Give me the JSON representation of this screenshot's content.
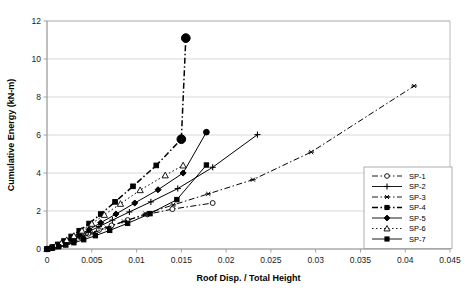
{
  "chart_data": {
    "type": "line",
    "title": "",
    "xlabel": "Roof Disp. / Total Height",
    "ylabel": "Cumulative Energy (kN-m)",
    "xlim": [
      0,
      0.045
    ],
    "ylim": [
      0,
      12
    ],
    "xticks": [
      "0",
      "0.005",
      "0.01",
      "0.015",
      "0.02",
      "0.025",
      "0.03",
      "0.035",
      "0.04",
      "0.045"
    ],
    "xtick_values": [
      0,
      0.005,
      0.01,
      0.015,
      0.02,
      0.025,
      0.03,
      0.035,
      0.04,
      0.045
    ],
    "yticks": [
      "0",
      "2",
      "4",
      "6",
      "8",
      "10",
      "12"
    ],
    "ytick_values": [
      0,
      2,
      4,
      6,
      8,
      10,
      12
    ],
    "grid": "horizontal",
    "legend_position": "bottom-right",
    "series": [
      {
        "name": "SP-1",
        "marker": "open-circle",
        "dash": "dashdot",
        "x": [
          0.0,
          0.0004,
          0.0008,
          0.0013,
          0.0018,
          0.0024,
          0.003,
          0.0037,
          0.0046,
          0.0058,
          0.0072,
          0.009,
          0.0112,
          0.014,
          0.0185
        ],
        "y": [
          0.0,
          0.05,
          0.11,
          0.19,
          0.28,
          0.38,
          0.5,
          0.63,
          0.8,
          1.0,
          1.24,
          1.52,
          1.82,
          2.1,
          2.42
        ]
      },
      {
        "name": "SP-2",
        "marker": "plus",
        "dash": "solid",
        "x": [
          0.0,
          0.0005,
          0.001,
          0.0016,
          0.0022,
          0.0029,
          0.0037,
          0.0046,
          0.0058,
          0.0073,
          0.0092,
          0.0116,
          0.0146,
          0.0185,
          0.0235
        ],
        "y": [
          0.0,
          0.06,
          0.14,
          0.24,
          0.36,
          0.5,
          0.68,
          0.9,
          1.18,
          1.52,
          1.95,
          2.48,
          3.18,
          4.3,
          6.02
        ]
      },
      {
        "name": "SP-3",
        "marker": "asterisk",
        "dash": "dashdot",
        "x": [
          0.0,
          0.0005,
          0.001,
          0.0016,
          0.0023,
          0.0031,
          0.004,
          0.0052,
          0.0067,
          0.0086,
          0.011,
          0.0141,
          0.018,
          0.023,
          0.0295,
          0.041
        ],
        "y": [
          0.0,
          0.05,
          0.12,
          0.21,
          0.32,
          0.46,
          0.63,
          0.85,
          1.12,
          1.45,
          1.85,
          2.32,
          2.9,
          3.65,
          5.1,
          8.58
        ]
      },
      {
        "name": "SP-4",
        "marker": "filled-square",
        "dash": "dashdot",
        "x": [
          0.0,
          0.0006,
          0.0012,
          0.0019,
          0.0027,
          0.0036,
          0.0047,
          0.006,
          0.0076,
          0.0096,
          0.0122,
          0.015,
          0.0155
        ],
        "y": [
          0.0,
          0.1,
          0.24,
          0.42,
          0.66,
          0.96,
          1.34,
          1.84,
          2.48,
          3.3,
          4.4,
          5.78,
          11.1
        ]
      },
      {
        "name": "SP-5",
        "marker": "filled-diamond",
        "dash": "solid",
        "x": [
          0.0,
          0.0006,
          0.0012,
          0.0019,
          0.0027,
          0.0036,
          0.0047,
          0.006,
          0.0077,
          0.0098,
          0.0124,
          0.0152,
          0.0178
        ],
        "y": [
          0.0,
          0.08,
          0.19,
          0.33,
          0.51,
          0.74,
          1.02,
          1.38,
          1.84,
          2.42,
          3.12,
          4.0,
          6.15
        ]
      },
      {
        "name": "SP-6",
        "marker": "open-triangle",
        "dash": "dotted",
        "x": [
          0.0,
          0.0005,
          0.001,
          0.0016,
          0.0022,
          0.003,
          0.0039,
          0.005,
          0.0064,
          0.0082,
          0.0104,
          0.0132,
          0.0152
        ],
        "y": [
          0.0,
          0.07,
          0.17,
          0.3,
          0.47,
          0.69,
          0.97,
          1.33,
          1.8,
          2.38,
          3.1,
          3.88,
          4.4
        ]
      },
      {
        "name": "SP-7",
        "marker": "filled-square",
        "dash": "solid",
        "x": [
          0.0,
          0.0006,
          0.0013,
          0.0021,
          0.003,
          0.0041,
          0.0054,
          0.007,
          0.009,
          0.0115,
          0.0145,
          0.0178
        ],
        "y": [
          0.0,
          0.05,
          0.12,
          0.21,
          0.33,
          0.49,
          0.7,
          0.98,
          1.35,
          1.86,
          2.6,
          4.42
        ]
      }
    ]
  },
  "legend": {
    "items": [
      {
        "label": "SP-1"
      },
      {
        "label": "SP-2"
      },
      {
        "label": "SP-3"
      },
      {
        "label": "SP-4"
      },
      {
        "label": "SP-5"
      },
      {
        "label": "SP-6"
      },
      {
        "label": "SP-7"
      }
    ]
  }
}
